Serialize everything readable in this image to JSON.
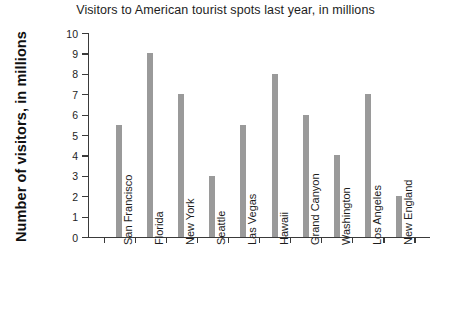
{
  "chart_data": {
    "type": "bar",
    "title": "Visitors to American tourist spots last year, in millions",
    "xlabel": "",
    "ylabel": "Number of visitors, in millions",
    "ylim": [
      0,
      10
    ],
    "ytick_labels": [
      "10",
      "9",
      "8",
      "7",
      "6",
      "5",
      "4",
      "3",
      "2",
      "1",
      "0"
    ],
    "ytick_values": [
      10,
      9,
      8,
      7,
      6,
      5,
      4,
      3,
      2,
      1,
      0
    ],
    "grid": false,
    "legend": null,
    "bar_color": "#9a9a9a",
    "axis_color": "#3a3a3a",
    "categories": [
      "San Francisco",
      "Florida",
      "New York",
      "Seattle",
      "Las Vegas",
      "Hawaii",
      "Grand Canyon",
      "Washington",
      "Los Angeles",
      "New England"
    ],
    "values": [
      5.5,
      9,
      7,
      3,
      5.5,
      8,
      6,
      4,
      7,
      2
    ]
  }
}
